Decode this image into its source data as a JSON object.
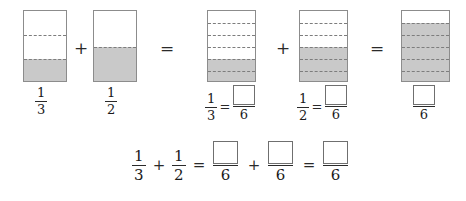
{
  "worksheet": {
    "title": "Fraction addition with bar models",
    "colors": {
      "shade": "#c9c9c9",
      "outline": "#8c8c8c",
      "dash": "#7d7d7d",
      "ink": "#1a1a1a",
      "paper": "#ffffff"
    },
    "symbols": {
      "plus": "+",
      "equals": "=",
      "blank": ""
    },
    "row1": {
      "name": "visual-models-row",
      "models": [
        {
          "name": "model-one-third",
          "denominator": 3,
          "shaded": 1,
          "label_numerator": "1",
          "label_denominator": "3"
        },
        {
          "name": "model-one-half",
          "denominator": 2,
          "shaded": 1,
          "label_numerator": "1",
          "label_denominator": "2"
        },
        {
          "name": "model-two-sixths",
          "denominator": 6,
          "shaded": 2,
          "equation_numerator": "1",
          "equation_denominator": "3",
          "answer_numerator": "",
          "answer_denominator": "6"
        },
        {
          "name": "model-three-sixths",
          "denominator": 6,
          "shaded": 3,
          "equation_numerator": "1",
          "equation_denominator": "2",
          "answer_numerator": "",
          "answer_denominator": "6"
        },
        {
          "name": "model-five-sixths",
          "denominator": 6,
          "shaded": 5,
          "answer_numerator": "",
          "answer_denominator": "6"
        }
      ],
      "operators": [
        "+",
        "=",
        "+",
        "="
      ]
    },
    "row2": {
      "name": "equation-row",
      "terms": [
        {
          "numerator": "1",
          "denominator": "3",
          "blank": false
        },
        {
          "numerator": "1",
          "denominator": "2",
          "blank": false
        },
        {
          "numerator": "",
          "denominator": "6",
          "blank": true
        },
        {
          "numerator": "",
          "denominator": "6",
          "blank": true
        },
        {
          "numerator": "",
          "denominator": "6",
          "blank": true
        }
      ],
      "operators": [
        "+",
        "=",
        "+",
        "="
      ]
    }
  }
}
